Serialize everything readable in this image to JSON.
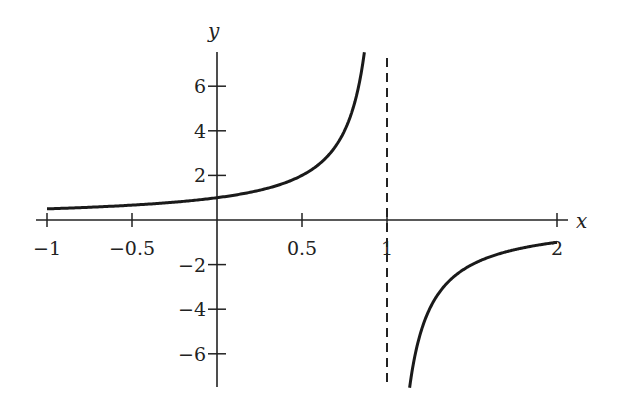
{
  "chart_data": {
    "type": "line",
    "title": "",
    "function": "y = 1/(1 - x)",
    "xlabel": "x",
    "ylabel": "y",
    "xlim": [
      -1,
      2
    ],
    "ylim": [
      -7.5,
      7.5
    ],
    "grid": false,
    "legend": null,
    "x_ticks": [
      {
        "value": -1,
        "label": "−1"
      },
      {
        "value": -0.5,
        "label": "−0.5"
      },
      {
        "value": 0.5,
        "label": "0.5"
      },
      {
        "value": 1,
        "label": "1"
      },
      {
        "value": 2,
        "label": "2"
      }
    ],
    "y_ticks": [
      {
        "value": 6,
        "label": "6"
      },
      {
        "value": 4,
        "label": "4"
      },
      {
        "value": 2,
        "label": "2"
      },
      {
        "value": -2,
        "label": "−2"
      },
      {
        "value": -4,
        "label": "−4"
      },
      {
        "value": -6,
        "label": "−6"
      }
    ],
    "asymptote": {
      "x": 1,
      "style": "dashed"
    },
    "series": [
      {
        "name": "left-branch",
        "x": [
          -1,
          -0.5,
          0,
          0.25,
          0.5,
          0.6,
          0.7,
          0.75,
          0.8,
          0.85,
          0.867
        ],
        "y": [
          0.5,
          0.667,
          1,
          1.333,
          2,
          2.5,
          3.333,
          4,
          5,
          6.667,
          7.5
        ]
      },
      {
        "name": "right-branch",
        "x": [
          1.133,
          1.15,
          1.2,
          1.25,
          1.3,
          1.4,
          1.5,
          1.6,
          1.75,
          2
        ],
        "y": [
          -7.5,
          -6.667,
          -5,
          -4,
          -3.333,
          -2.5,
          -2,
          -1.667,
          -1.333,
          -1
        ]
      }
    ]
  }
}
